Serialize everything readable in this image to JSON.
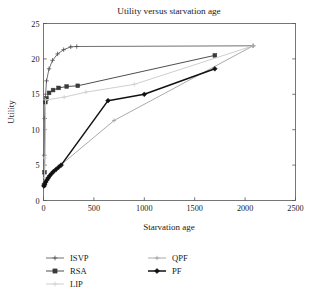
{
  "chart_data": {
    "type": "line",
    "title": "Utility versus starvation age",
    "xlabel": "Starvation age",
    "ylabel": "Utility",
    "xlim": [
      0,
      2500
    ],
    "ylim": [
      0,
      25
    ],
    "xticks": [
      0,
      500,
      1000,
      1500,
      2000,
      2500
    ],
    "yticks": [
      0,
      5,
      10,
      15,
      20,
      25
    ],
    "xtick_labels": [
      "0",
      "500",
      "1000",
      "1500",
      "2000",
      "2500"
    ],
    "ytick_labels": [
      "0",
      "5",
      "10",
      "15",
      "20",
      "25"
    ],
    "grid": false,
    "legend_position": "below",
    "series": [
      {
        "name": "ISVP",
        "color": "#4d4d4d",
        "width": 0.8,
        "marker": "plus",
        "marker_size": 2.2,
        "points": [
          [
            5,
            2.2
          ],
          [
            8,
            6.4
          ],
          [
            12,
            11.6
          ],
          [
            16,
            14.0
          ],
          [
            30,
            16.9
          ],
          [
            55,
            18.6
          ],
          [
            90,
            19.8
          ],
          [
            140,
            20.7
          ],
          [
            200,
            21.3
          ],
          [
            270,
            21.7
          ],
          [
            330,
            21.75
          ],
          [
            2080,
            21.85
          ]
        ]
      },
      {
        "name": "RSA",
        "color": "#3a3a3a",
        "width": 0.9,
        "marker": "square",
        "marker_size": 1.9,
        "points": [
          [
            5,
            2.2
          ],
          [
            10,
            4.0
          ],
          [
            18,
            13.9
          ],
          [
            30,
            14.4
          ],
          [
            55,
            15.2
          ],
          [
            95,
            15.6
          ],
          [
            150,
            15.9
          ],
          [
            230,
            16.1
          ],
          [
            340,
            16.2
          ],
          [
            1700,
            20.5
          ]
        ]
      },
      {
        "name": "LIP",
        "color": "#cfcfcf",
        "width": 1.0,
        "marker": "plus",
        "marker_size": 2.2,
        "points": [
          [
            5,
            2.3
          ],
          [
            10,
            3.2
          ],
          [
            14,
            6.0
          ],
          [
            20,
            14.2
          ],
          [
            205,
            14.6
          ],
          [
            420,
            15.3
          ],
          [
            900,
            16.4
          ],
          [
            2080,
            21.85
          ]
        ]
      },
      {
        "name": "QPF",
        "color": "#a0a0a0",
        "width": 0.9,
        "marker": "plus",
        "marker_size": 2.0,
        "points": [
          [
            5,
            2.1
          ],
          [
            20,
            2.6
          ],
          [
            45,
            3.3
          ],
          [
            90,
            4.0
          ],
          [
            170,
            5.0
          ],
          [
            700,
            11.3
          ],
          [
            2080,
            21.85
          ]
        ]
      },
      {
        "name": "PF",
        "color": "#111111",
        "width": 1.5,
        "marker": "diamond",
        "marker_size": 2.4,
        "points": [
          [
            5,
            2.05
          ],
          [
            12,
            2.3
          ],
          [
            22,
            2.6
          ],
          [
            34,
            2.9
          ],
          [
            48,
            3.2
          ],
          [
            62,
            3.5
          ],
          [
            80,
            3.8
          ],
          [
            100,
            4.1
          ],
          [
            125,
            4.4
          ],
          [
            150,
            4.7
          ],
          [
            175,
            5.0
          ],
          [
            640,
            14.1
          ],
          [
            1000,
            15.0
          ],
          [
            1700,
            18.6
          ]
        ]
      }
    ]
  },
  "legend": {
    "entries": [
      {
        "label": "ISVP",
        "column": 0,
        "row": 0
      },
      {
        "label": "RSA",
        "column": 0,
        "row": 1
      },
      {
        "label": "LIP",
        "column": 0,
        "row": 2
      },
      {
        "label": "QPF",
        "column": 1,
        "row": 0
      },
      {
        "label": "PF",
        "column": 1,
        "row": 1
      }
    ]
  }
}
